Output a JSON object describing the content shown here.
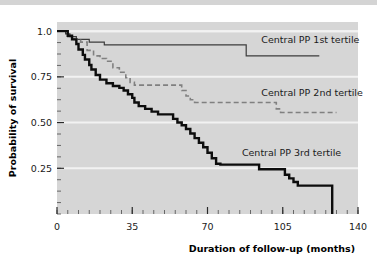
{
  "figure": {
    "background_color": "#ffffff",
    "plot_background_color": "#d6d6d6",
    "gridline_color": "#f2f2f2",
    "top_band_color": "#d4d4d4"
  },
  "chart_data": {
    "type": "line",
    "title": "",
    "subtitle": "",
    "xlabel": "Duration of follow-up (months)",
    "ylabel": "Probability of survival",
    "xlim": [
      0,
      140
    ],
    "ylim": [
      0,
      1.05
    ],
    "xticks": [
      0,
      35,
      70,
      105,
      140
    ],
    "xtick_labels": [
      "0",
      "35",
      "70",
      "105",
      "140"
    ],
    "yticks": [
      0.25,
      0.5,
      0.75,
      1.0
    ],
    "ytick_labels": [
      "0.25",
      "0.50",
      "0.75",
      "1.0"
    ],
    "grid": "horizontal-major-white",
    "legend_position": "inline-right-of-curves",
    "minor_ticks": true,
    "annotations": [
      {
        "text": "Central PP 1st tertile",
        "x": 95,
        "y": 0.955,
        "series": "Central PP 1st tertile"
      },
      {
        "text": "Central PP 2nd tertile",
        "x": 95,
        "y": 0.665,
        "series": "Central PP 2nd tertile"
      },
      {
        "text": "Central PP 3rd tertile",
        "x": 86,
        "y": 0.335,
        "series": "Central PP 3rd tertile"
      }
    ],
    "series": [
      {
        "name": "Central PP 1st tertile",
        "style": "solid",
        "color": "#3d3d3d",
        "line_width": 1.2,
        "steps": [
          [
            0,
            1.0
          ],
          [
            2,
            1.0
          ],
          [
            4,
            0.985
          ],
          [
            6,
            0.97
          ],
          [
            9,
            0.955
          ],
          [
            12,
            0.955
          ],
          [
            15,
            0.94
          ],
          [
            20,
            0.94
          ],
          [
            22,
            0.925
          ],
          [
            88,
            0.925
          ],
          [
            88,
            0.865
          ],
          [
            122,
            0.865
          ]
        ]
      },
      {
        "name": "Central PP 2nd tertile",
        "style": "dashed",
        "color": "#808080",
        "line_width": 1.6,
        "steps": [
          [
            0,
            1.0
          ],
          [
            3,
            1.0
          ],
          [
            5,
            0.97
          ],
          [
            8,
            0.955
          ],
          [
            11,
            0.94
          ],
          [
            14,
            0.895
          ],
          [
            17,
            0.865
          ],
          [
            20,
            0.85
          ],
          [
            23,
            0.835
          ],
          [
            26,
            0.8
          ],
          [
            29,
            0.775
          ],
          [
            32,
            0.745
          ],
          [
            34,
            0.72
          ],
          [
            36,
            0.705
          ],
          [
            56,
            0.705
          ],
          [
            58,
            0.675
          ],
          [
            60,
            0.645
          ],
          [
            62,
            0.625
          ],
          [
            64,
            0.61
          ],
          [
            100,
            0.61
          ],
          [
            102,
            0.575
          ],
          [
            104,
            0.555
          ],
          [
            130,
            0.555
          ]
        ]
      },
      {
        "name": "Central PP 3rd tertile",
        "style": "solid",
        "color": "#0d0d0d",
        "line_width": 2.4,
        "steps": [
          [
            0,
            1.0
          ],
          [
            3,
            1.0
          ],
          [
            5,
            0.975
          ],
          [
            7,
            0.955
          ],
          [
            9,
            0.93
          ],
          [
            10,
            0.9
          ],
          [
            12,
            0.87
          ],
          [
            13,
            0.845
          ],
          [
            15,
            0.815
          ],
          [
            16,
            0.79
          ],
          [
            18,
            0.76
          ],
          [
            20,
            0.735
          ],
          [
            23,
            0.715
          ],
          [
            26,
            0.7
          ],
          [
            29,
            0.69
          ],
          [
            31,
            0.675
          ],
          [
            33,
            0.655
          ],
          [
            35,
            0.635
          ],
          [
            36,
            0.61
          ],
          [
            38,
            0.59
          ],
          [
            41,
            0.575
          ],
          [
            44,
            0.56
          ],
          [
            47,
            0.545
          ],
          [
            52,
            0.545
          ],
          [
            54,
            0.52
          ],
          [
            56,
            0.5
          ],
          [
            58,
            0.485
          ],
          [
            60,
            0.465
          ],
          [
            62,
            0.44
          ],
          [
            64,
            0.415
          ],
          [
            66,
            0.39
          ],
          [
            68,
            0.365
          ],
          [
            70,
            0.335
          ],
          [
            72,
            0.305
          ],
          [
            74,
            0.275
          ],
          [
            76,
            0.27
          ],
          [
            92,
            0.27
          ],
          [
            94,
            0.245
          ],
          [
            104,
            0.245
          ],
          [
            106,
            0.215
          ],
          [
            108,
            0.195
          ],
          [
            110,
            0.175
          ],
          [
            112,
            0.155
          ],
          [
            128,
            0.155
          ],
          [
            128,
            0.0
          ]
        ]
      }
    ]
  }
}
